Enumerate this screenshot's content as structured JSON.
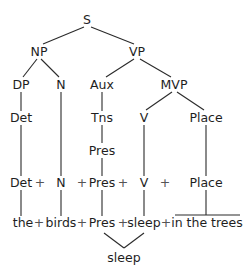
{
  "tree": {
    "nodes": [
      {
        "id": "S",
        "label": "S",
        "x": 87,
        "y": 20
      },
      {
        "id": "NP",
        "label": "NP",
        "x": 39,
        "y": 52
      },
      {
        "id": "VP",
        "label": "VP",
        "x": 137,
        "y": 52
      },
      {
        "id": "DP",
        "label": "DP",
        "x": 21,
        "y": 85
      },
      {
        "id": "N",
        "label": "N",
        "x": 61,
        "y": 85
      },
      {
        "id": "Aux",
        "label": "Aux",
        "x": 102,
        "y": 85
      },
      {
        "id": "MVP",
        "label": "MVP",
        "x": 174,
        "y": 85
      },
      {
        "id": "Det",
        "label": "Det",
        "x": 21,
        "y": 118
      },
      {
        "id": "Tns",
        "label": "Tns",
        "x": 102,
        "y": 118
      },
      {
        "id": "V",
        "label": "V",
        "x": 144,
        "y": 118
      },
      {
        "id": "Place",
        "label": "Place",
        "x": 206,
        "y": 118
      },
      {
        "id": "Pres",
        "label": "Pres",
        "x": 102,
        "y": 151
      }
    ],
    "edges": [
      [
        "S",
        "NP"
      ],
      [
        "S",
        "VP"
      ],
      [
        "NP",
        "DP"
      ],
      [
        "NP",
        "N"
      ],
      [
        "VP",
        "Aux"
      ],
      [
        "VP",
        "MVP"
      ],
      [
        "DP",
        "Det"
      ],
      [
        "Aux",
        "Tns"
      ],
      [
        "MVP",
        "V"
      ],
      [
        "MVP",
        "Place"
      ],
      [
        "Tns",
        "Pres"
      ]
    ]
  },
  "row_categories": {
    "det": "Det",
    "plus1": "+",
    "n": "N",
    "plus2": "+",
    "pres": "Pres",
    "plus3": "+",
    "v": "V",
    "plus4": "+",
    "place": "Place"
  },
  "row_words": {
    "the": "the",
    "plus1": "+",
    "birds": "birds",
    "plus2": "+",
    "pres": "Pres",
    "plus3": "+",
    "sleep": "sleep",
    "plus4": "+",
    "in_the_trees": "in the trees"
  },
  "merged": {
    "label": "sleep"
  }
}
